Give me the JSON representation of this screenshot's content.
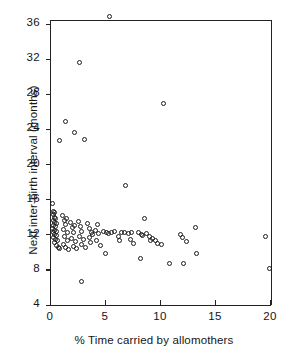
{
  "chart_data": {
    "type": "scatter",
    "title": "",
    "xlabel": "% Time carried by allomothers",
    "ylabel": "Next inter-birth interval (months)",
    "xlim": [
      0,
      20
    ],
    "ylim": [
      4,
      36.8
    ],
    "xticks": [
      0,
      5,
      10,
      15,
      20
    ],
    "xticklabels": [
      "0",
      "5",
      "10",
      "15",
      "20"
    ],
    "yticks": [
      4,
      8,
      12,
      16,
      20,
      24,
      28,
      32,
      36
    ],
    "yticklabels": [
      "4",
      "8",
      "12",
      "16",
      "20",
      "24",
      "28",
      "32",
      "36"
    ],
    "grid": false,
    "legend": null,
    "marker": "open-circle",
    "marker_color": "#1c1c1c",
    "frame": "box-top-right-open-ticks-left-bottom",
    "points": [
      [
        5.45,
        36.9
      ],
      [
        2.65,
        31.6
      ],
      [
        10.3,
        26.9
      ],
      [
        1.45,
        24.9
      ],
      [
        2.25,
        23.6
      ],
      [
        0.85,
        22.7
      ],
      [
        3.15,
        22.9
      ],
      [
        6.85,
        17.6
      ],
      [
        0.25,
        15.6
      ],
      [
        0.35,
        14.6
      ],
      [
        0.45,
        14.5
      ],
      [
        0.3,
        14.3
      ],
      [
        0.4,
        14.0
      ],
      [
        0.5,
        13.9
      ],
      [
        0.3,
        13.6
      ],
      [
        0.45,
        13.4
      ],
      [
        0.6,
        13.3
      ],
      [
        0.35,
        13.1
      ],
      [
        0.5,
        12.9
      ],
      [
        0.25,
        12.7
      ],
      [
        0.4,
        12.5
      ],
      [
        0.55,
        12.4
      ],
      [
        0.3,
        12.2
      ],
      [
        0.45,
        12.0
      ],
      [
        0.6,
        11.9
      ],
      [
        0.35,
        11.7
      ],
      [
        0.5,
        11.5
      ],
      [
        0.7,
        11.3
      ],
      [
        0.4,
        11.1
      ],
      [
        0.6,
        10.8
      ],
      [
        0.8,
        10.6
      ],
      [
        0.9,
        10.4
      ],
      [
        1.15,
        14.2
      ],
      [
        1.3,
        13.6
      ],
      [
        1.5,
        13.9
      ],
      [
        1.45,
        13.2
      ],
      [
        1.25,
        12.6
      ],
      [
        1.6,
        12.3
      ],
      [
        1.35,
        11.8
      ],
      [
        1.55,
        11.4
      ],
      [
        1.2,
        10.9
      ],
      [
        1.45,
        10.5
      ],
      [
        1.7,
        10.3
      ],
      [
        1.9,
        13.4
      ],
      [
        2.05,
        12.8
      ],
      [
        2.2,
        13.1
      ],
      [
        2.15,
        12.2
      ],
      [
        1.95,
        11.6
      ],
      [
        2.3,
        11.2
      ],
      [
        2.1,
        10.7
      ],
      [
        2.45,
        10.4
      ],
      [
        2.6,
        13.5
      ],
      [
        2.75,
        12.9
      ],
      [
        2.9,
        12.4
      ],
      [
        2.7,
        11.8
      ],
      [
        3.05,
        11.5
      ],
      [
        2.85,
        10.9
      ],
      [
        3.2,
        10.5
      ],
      [
        2.9,
        6.7
      ],
      [
        3.4,
        13.3
      ],
      [
        3.6,
        12.7
      ],
      [
        3.75,
        12.2
      ],
      [
        3.55,
        11.7
      ],
      [
        3.9,
        12.0
      ],
      [
        3.7,
        11.1
      ],
      [
        4.1,
        12.5
      ],
      [
        4.3,
        13.2
      ],
      [
        4.45,
        12.1
      ],
      [
        4.25,
        11.3
      ],
      [
        4.6,
        10.8
      ],
      [
        4.85,
        12.4
      ],
      [
        5.1,
        12.3
      ],
      [
        5.3,
        12.1
      ],
      [
        5.05,
        9.9
      ],
      [
        5.6,
        12.2
      ],
      [
        5.9,
        12.4
      ],
      [
        6.2,
        11.8
      ],
      [
        6.5,
        12.2
      ],
      [
        6.35,
        11.4
      ],
      [
        6.8,
        12.3
      ],
      [
        7.1,
        12.1
      ],
      [
        7.4,
        12.2
      ],
      [
        7.3,
        11.5
      ],
      [
        7.6,
        11.0
      ],
      [
        8.0,
        12.2
      ],
      [
        8.3,
        12.0
      ],
      [
        8.55,
        13.8
      ],
      [
        8.45,
        11.9
      ],
      [
        8.2,
        9.3
      ],
      [
        8.8,
        12.1
      ],
      [
        9.05,
        11.8
      ],
      [
        9.3,
        11.6
      ],
      [
        9.15,
        11.3
      ],
      [
        9.55,
        11.4
      ],
      [
        9.75,
        11.0
      ],
      [
        10.1,
        10.9
      ],
      [
        10.9,
        8.7
      ],
      [
        11.9,
        12.0
      ],
      [
        12.05,
        11.7
      ],
      [
        12.1,
        8.7
      ],
      [
        12.4,
        11.2
      ],
      [
        13.2,
        12.8
      ],
      [
        13.35,
        9.9
      ],
      [
        19.6,
        11.8
      ],
      [
        19.95,
        8.2
      ]
    ]
  }
}
